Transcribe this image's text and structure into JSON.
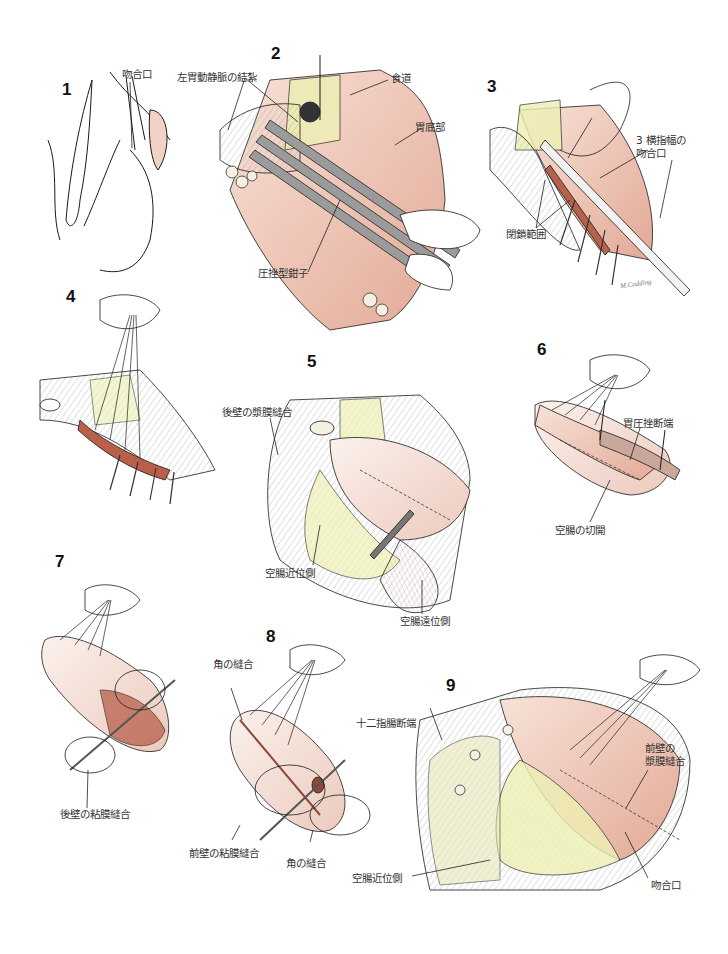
{
  "figure": {
    "title": "",
    "colors": {
      "ink": "#1a1a1a",
      "tissue_pink": "#e9b9a8",
      "tissue_light": "#f6dcd0",
      "mucosa": "#b9604b",
      "fat_yellow": "#eef0b4",
      "instrument_gray": "#8a8a8a"
    },
    "signature": "M.Codding",
    "panels": [
      {
        "number": "1",
        "labels": [
          "吻合口"
        ]
      },
      {
        "number": "2",
        "labels": [
          "左胃動静脈の結紮",
          "食道",
          "胃底部",
          "圧挫型鉗子"
        ]
      },
      {
        "number": "3",
        "labels": [
          "3 横指幅の\n吻合口",
          "閉鎖範囲"
        ]
      },
      {
        "number": "4",
        "labels": []
      },
      {
        "number": "5",
        "labels": [
          "後壁の漿膜縫合",
          "空腸近位側",
          "空腸遠位側"
        ]
      },
      {
        "number": "6",
        "labels": [
          "胃圧挫断端",
          "空腸の切開"
        ]
      },
      {
        "number": "7",
        "labels": [
          "後壁の粘膜縫合"
        ]
      },
      {
        "number": "8",
        "labels": [
          "角の縫合",
          "前壁の粘膜縫合",
          "角の縫合"
        ]
      },
      {
        "number": "9",
        "labels": [
          "十二指腸断端",
          "前壁の\n漿膜縫合",
          "空腸近位側",
          "吻合口"
        ]
      }
    ]
  }
}
